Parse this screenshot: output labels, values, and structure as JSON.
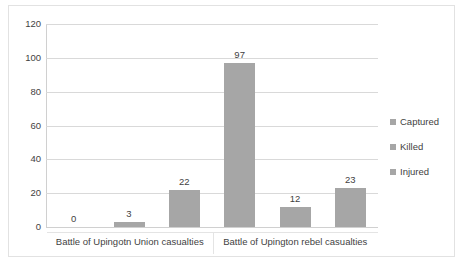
{
  "chart_data": {
    "type": "bar",
    "title": "",
    "xlabel": "",
    "ylabel": "",
    "categories": [
      "Battle of Upingotn Union casualties",
      "Battle of Upington rebel casualties"
    ],
    "series": [
      {
        "name": "Captured",
        "values": [
          0,
          97
        ],
        "color": "#A6A6A6"
      },
      {
        "name": "Killed",
        "values": [
          3,
          12
        ],
        "color": "#A6A6A6"
      },
      {
        "name": "Injured",
        "values": [
          22,
          23
        ],
        "color": "#A6A6A6"
      }
    ],
    "ylim": [
      0,
      120
    ],
    "yticks": [
      0,
      20,
      40,
      60,
      80,
      100,
      120
    ],
    "ytick_labels": [
      "0",
      "20",
      "40",
      "60",
      "80",
      "100",
      "120"
    ],
    "data_labels": [
      [
        "0",
        "3",
        "22"
      ],
      [
        "97",
        "12",
        "23"
      ]
    ],
    "grid": true,
    "legend_position": "right",
    "legend_entries": [
      "Captured",
      "Killed",
      "Injured"
    ],
    "bar_color": "#A6A6A6",
    "gridline_color": "#D9D9D9",
    "text_color": "#3F3F3F",
    "border_color": "#E2E2E2",
    "background": "#FFFFFF"
  }
}
